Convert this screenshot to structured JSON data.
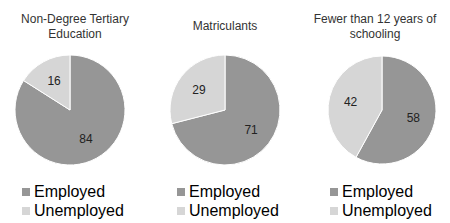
{
  "chart_data": [
    {
      "type": "pie",
      "title": "Non-Degree Tertiary Education",
      "categories": [
        "Employed",
        "Unemployed"
      ],
      "values": [
        84,
        16
      ],
      "legend": [
        "Employed",
        "Unemployed"
      ],
      "colors": [
        "#969696",
        "#d6d6d6"
      ]
    },
    {
      "type": "pie",
      "title": "Matriculants",
      "categories": [
        "Employed",
        "Unemployed"
      ],
      "values": [
        71,
        29
      ],
      "legend": [
        "Employed",
        "Unemployed"
      ],
      "colors": [
        "#969696",
        "#d6d6d6"
      ]
    },
    {
      "type": "pie",
      "title": "Fewer than 12 years of schooling",
      "categories": [
        "Employed",
        "Unemployed"
      ],
      "values": [
        58,
        42
      ],
      "legend": [
        "Employed",
        "Unemployed"
      ],
      "colors": [
        "#969696",
        "#d6d6d6"
      ]
    }
  ],
  "charts": [
    {
      "title_line1": "Non-Degree Tertiary",
      "title_line2": "Education",
      "employed": "84",
      "unemployed": "16",
      "legend_employed": "Employed",
      "legend_unemployed": "Unemployed"
    },
    {
      "title_line1": "Matriculants",
      "title_line2": "",
      "employed": "71",
      "unemployed": "29",
      "legend_employed": "Employed",
      "legend_unemployed": "Unemployed"
    },
    {
      "title_line1": "Fewer than 12 years of",
      "title_line2": "schooling",
      "employed": "58",
      "unemployed": "42",
      "legend_employed": "Employed",
      "legend_unemployed": "Unemployed"
    }
  ]
}
